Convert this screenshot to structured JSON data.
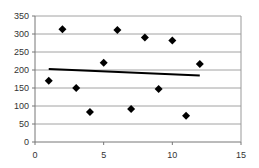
{
  "chart_data": {
    "type": "scatter",
    "title": "",
    "xlabel": "",
    "ylabel": "",
    "xlim": [
      0,
      15
    ],
    "ylim": [
      0,
      350
    ],
    "x_ticks": [
      0,
      5,
      10,
      15
    ],
    "y_ticks": [
      0,
      50,
      100,
      150,
      200,
      250,
      300,
      350
    ],
    "grid": {
      "horizontal": true,
      "vertical": false
    },
    "legend": null,
    "series": [
      {
        "name": "data",
        "marker": "diamond",
        "color": "#000000",
        "x": [
          1,
          2,
          3,
          4,
          5,
          6,
          7,
          8,
          9,
          10,
          11,
          12
        ],
        "y": [
          170,
          313,
          150,
          83,
          220,
          311,
          92,
          290,
          147,
          282,
          73,
          217
        ]
      }
    ],
    "trendline": {
      "type": "linear",
      "color": "#000000",
      "x": [
        1,
        12
      ],
      "y": [
        203,
        185
      ]
    }
  }
}
